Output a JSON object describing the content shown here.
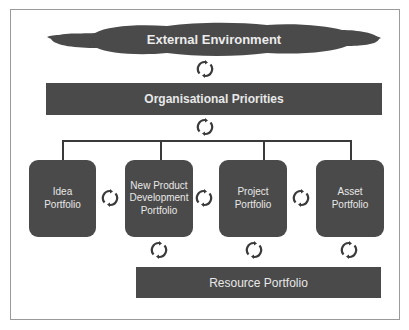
{
  "diagram": {
    "external": {
      "label": "External Environment"
    },
    "priorities": {
      "label": "Organisational Priorities"
    },
    "portfolios": [
      {
        "label": "Idea\nPortfolio"
      },
      {
        "label": "New Product\nDevelopment\nPortfolio"
      },
      {
        "label": "Project\nPortfolio"
      },
      {
        "label": "Asset\nPortfolio"
      }
    ],
    "resource": {
      "label": "Resource Portfolio"
    },
    "icons": {
      "cycle": "cycle-arrows-icon"
    },
    "colors": {
      "box_fill": "#4a4a4a",
      "box_text": "#e8e8e8",
      "connector": "#3a3a3a",
      "frame": "#9a9a9a"
    }
  }
}
